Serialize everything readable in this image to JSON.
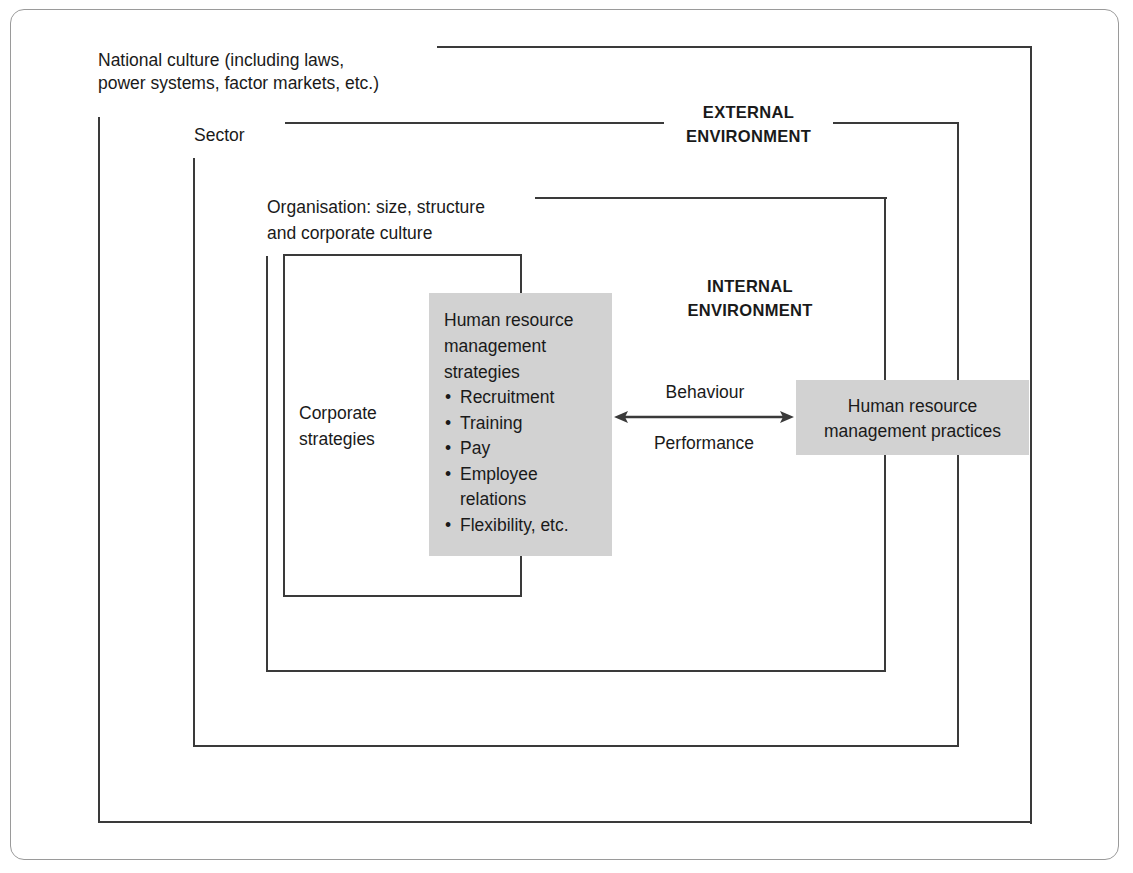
{
  "diagram": {
    "type": "nested-environment-diagram",
    "layers": {
      "national": {
        "label_line1": "National culture (including laws,",
        "label_line2": "power systems, factor markets, etc.)"
      },
      "sector": {
        "label": "Sector"
      },
      "external_environment": {
        "line1": "EXTERNAL",
        "line2": "ENVIRONMENT"
      },
      "organisation": {
        "label_line1": "Organisation: size, structure",
        "label_line2": "and corporate culture"
      },
      "internal_environment": {
        "line1": "INTERNAL",
        "line2": "ENVIRONMENT"
      },
      "corporate": {
        "label_line1": "Corporate",
        "label_line2": "strategies"
      }
    },
    "hrm_strategies": {
      "title_line1": "Human resource",
      "title_line2": "management",
      "title_line3": "strategies",
      "items": [
        "Recruitment",
        "Training",
        "Pay",
        "Employee",
        "Flexibility, etc."
      ],
      "item_continuation": "relations"
    },
    "link": {
      "label_top": "Behaviour",
      "label_bottom": "Performance",
      "direction": "bidirectional"
    },
    "hrm_practices": {
      "line1": "Human resource",
      "line2": "management practices"
    },
    "colors": {
      "line": "#3a3a3a",
      "grey_box": "#d2d2d2",
      "frame": "#9a9a9a",
      "text": "#1a1a1a"
    }
  }
}
